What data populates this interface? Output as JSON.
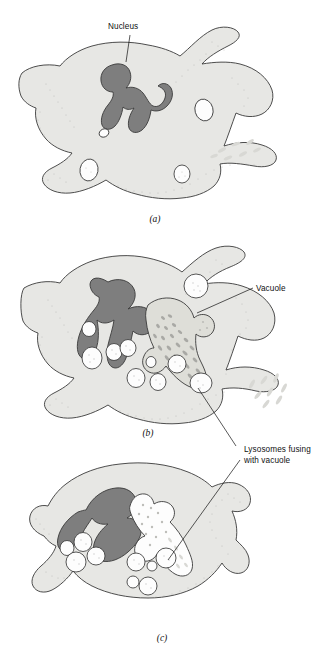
{
  "figure": {
    "background_color": "#ffffff",
    "colors": {
      "cytoplasm": "#e7e7e4",
      "nucleus": "#7e7e7e",
      "outline": "#3a3a3a",
      "vesicle": "#fdfdfd",
      "vacuole_filled": "#dedeD8",
      "vacuole_digested": "#fdfdfd",
      "bacteria_rod": "#a9a9a5",
      "label_text": "#111111"
    }
  },
  "panels": [
    {
      "id": "a",
      "caption": "(a)",
      "labels": [
        {
          "id": "nucleus",
          "text": "Nucleus"
        }
      ],
      "structures": [
        "cell-outline",
        "nucleus",
        "pseudopods",
        "vesicles",
        "extracellular-bacteria"
      ]
    },
    {
      "id": "b",
      "caption": "(b)",
      "labels": [
        {
          "id": "vacuole",
          "text": "Vacuole"
        }
      ],
      "structures": [
        "cell-outline",
        "nucleus",
        "food-vacuole-with-bacteria",
        "lysosomes",
        "extracellular-bacteria"
      ]
    },
    {
      "id": "c",
      "caption": "(c)",
      "labels": [],
      "structures": [
        "cell-outline",
        "nucleus",
        "digesting-vacuole",
        "lysosome-cluster"
      ]
    }
  ],
  "shared_labels": [
    {
      "id": "lysosomes-fusing",
      "line1": "Lysosomes fusing",
      "line2": "with vacuole",
      "points_to": [
        "b",
        "c"
      ]
    }
  ]
}
